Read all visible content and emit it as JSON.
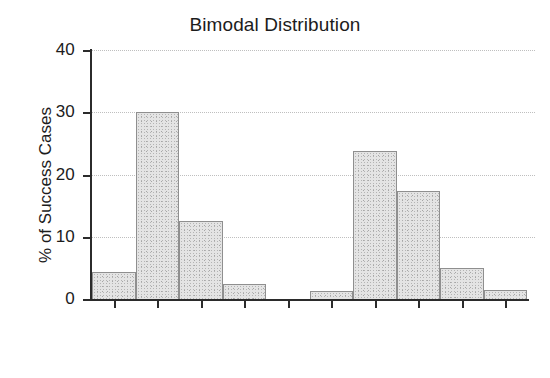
{
  "chart_data": {
    "type": "bar",
    "title": "Bimodal Distribution",
    "xlabel": "",
    "ylabel": "% of Success Cases",
    "categories": [
      "14500",
      "23500",
      "32500",
      "41500",
      "50500",
      "59500",
      "68500",
      "77500",
      "86500",
      "95500"
    ],
    "values": [
      4.3,
      30.0,
      12.5,
      2.4,
      0.0,
      1.3,
      23.8,
      17.3,
      5.0,
      1.5
    ],
    "ylim": [
      0,
      40
    ],
    "yticks": [
      0,
      10,
      20,
      30,
      40
    ],
    "ytick_labels": [
      "0",
      "10",
      "20",
      "30",
      "40"
    ],
    "grid": true,
    "grid_axis": "y",
    "legend": false,
    "bar_fill_color": "#e4e4e4",
    "bar_edge_color": "#8f8f8f",
    "axis_color": "#2b2b2b",
    "grid_color": "#bfbfbf",
    "background_color": "#ffffff",
    "xtick_label_rotation": -45
  }
}
